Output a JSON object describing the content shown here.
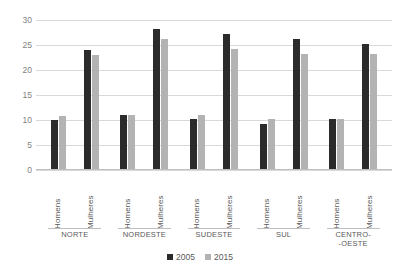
{
  "chart_data": {
    "type": "bar",
    "title": "",
    "subtitle": "",
    "xlabel": "",
    "ylabel": "",
    "ylim": [
      0,
      30
    ],
    "yticks": [
      30,
      25,
      20,
      15,
      10,
      5,
      0
    ],
    "grid": true,
    "legend_position": "bottom",
    "categories": [
      "NORTE / Homens",
      "NORTE / Mulheres",
      "NORDESTE / Homens",
      "NORDESTE / Mulheres",
      "SUDESTE / Homens",
      "SUDESTE / Mulheres",
      "SUL / Homens",
      "SUL / Mulheres",
      "CENTRO-OESTE / Homens",
      "CENTRO-OESTE / Mulheres"
    ],
    "series": [
      {
        "name": "2005",
        "color": "#2b2b2b",
        "values": [
          10.0,
          24.0,
          11.1,
          28.2,
          10.2,
          27.2,
          9.3,
          26.3,
          10.3,
          25.3
        ]
      },
      {
        "name": "2015",
        "color": "#b3b3b3",
        "values": [
          10.9,
          23.1,
          11.0,
          26.2,
          11.1,
          24.2,
          10.2,
          23.3,
          10.3,
          23.3
        ]
      }
    ],
    "groups": [
      {
        "region": "NORTE",
        "region_display": "NORTE",
        "clusters": [
          {
            "label": "Homens",
            "v2005": 10.0,
            "v2015": 10.9
          },
          {
            "label": "Mulheres",
            "v2005": 24.0,
            "v2015": 23.1
          }
        ]
      },
      {
        "region": "NORDESTE",
        "region_display": "NORDESTE",
        "clusters": [
          {
            "label": "Homens",
            "v2005": 11.1,
            "v2015": 11.0
          },
          {
            "label": "Mulheres",
            "v2005": 28.2,
            "v2015": 26.2
          }
        ]
      },
      {
        "region": "SUDESTE",
        "region_display": "SUDESTE",
        "clusters": [
          {
            "label": "Homens",
            "v2005": 10.2,
            "v2015": 11.1
          },
          {
            "label": "Mulheres",
            "v2005": 27.2,
            "v2015": 24.2
          }
        ]
      },
      {
        "region": "SUL",
        "region_display": "SUL",
        "clusters": [
          {
            "label": "Homens",
            "v2005": 9.3,
            "v2015": 10.2
          },
          {
            "label": "Mulheres",
            "v2005": 26.3,
            "v2015": 23.3
          }
        ]
      },
      {
        "region": "CENTRO-OESTE",
        "region_display": "CENTRO-\n-OESTE",
        "clusters": [
          {
            "label": "Homens",
            "v2005": 10.3,
            "v2015": 10.3
          },
          {
            "label": "Mulheres",
            "v2005": 25.3,
            "v2015": 23.3
          }
        ]
      }
    ],
    "legend": [
      {
        "label": "2005",
        "color": "#2b2b2b"
      },
      {
        "label": "2015",
        "color": "#b3b3b3"
      }
    ]
  }
}
